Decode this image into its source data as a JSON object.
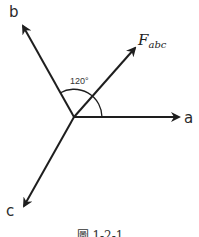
{
  "diagram": {
    "origin": {
      "x": 74,
      "y": 117
    },
    "vectors": [
      {
        "id": "a",
        "label": "a",
        "tip": {
          "x": 180,
          "y": 117
        }
      },
      {
        "id": "b",
        "label": "b",
        "tip": {
          "x": 22,
          "y": 24
        }
      },
      {
        "id": "c",
        "label": "c",
        "tip": {
          "x": 23,
          "y": 208
        }
      },
      {
        "id": "F",
        "label_main": "F",
        "label_sub": "abc",
        "tip": {
          "x": 136,
          "y": 47
        }
      }
    ],
    "angle": {
      "label": "120°",
      "from": "a",
      "to": "b",
      "degrees": 120
    },
    "caption": "圖 1-2-1",
    "colors": {
      "line": "#1e1e1e",
      "text": "#2a2a2a",
      "background": "#ffffff"
    }
  }
}
